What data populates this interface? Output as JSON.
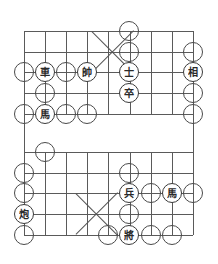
{
  "board": {
    "title": "Xiangqi Board",
    "type": "xiangqi-board",
    "files": 9,
    "ranks": 10,
    "geometry": {
      "left": 24,
      "top": 31,
      "col_step": 21.1,
      "row_step": 20.6,
      "river_top_row_y": 114,
      "river_bottom_row_y": 152,
      "piece_diameter": 20,
      "node_diameter": 20
    },
    "colors": {
      "line": "#5a5a5a",
      "piece_border": "#3a3a3a",
      "piece_text": "#2a2a2a",
      "node_border": "#4a4a4a",
      "background": "#ffffff"
    },
    "palaces": [
      {
        "name": "top-palace",
        "cx": 113,
        "cy": 52,
        "half": 21
      },
      {
        "name": "bottom-palace",
        "cx": 97,
        "cy": 214,
        "half": 21
      }
    ],
    "pieces": [
      {
        "id": "p1",
        "label": "車",
        "name": "piece-chariot-rook",
        "x": 45,
        "y": 72
      },
      {
        "id": "p2",
        "label": "帥",
        "name": "piece-marshal-red-king",
        "x": 87,
        "y": 72
      },
      {
        "id": "p3",
        "label": "士",
        "name": "piece-advisor",
        "x": 129,
        "y": 72
      },
      {
        "id": "p4",
        "label": "相",
        "name": "piece-minister-elephant",
        "x": 193,
        "y": 72
      },
      {
        "id": "p5",
        "label": "卒",
        "name": "piece-pawn-black",
        "x": 129,
        "y": 93
      },
      {
        "id": "p6",
        "label": "馬",
        "name": "piece-horse-top",
        "x": 45,
        "y": 114
      },
      {
        "id": "p7",
        "label": "兵",
        "name": "piece-soldier-red",
        "x": 129,
        "y": 193
      },
      {
        "id": "p8",
        "label": "馬",
        "name": "piece-horse-bottom",
        "x": 172,
        "y": 193
      },
      {
        "id": "p9",
        "label": "炮",
        "name": "piece-cannon",
        "x": 24,
        "y": 214
      },
      {
        "id": "p10",
        "label": "將",
        "name": "piece-general-black-king",
        "x": 129,
        "y": 235
      }
    ],
    "markers": [
      {
        "id": "m1",
        "x": 129,
        "y": 31
      },
      {
        "id": "m2",
        "x": 129,
        "y": 52
      },
      {
        "id": "m3",
        "x": 193,
        "y": 52
      },
      {
        "id": "m4",
        "x": 24,
        "y": 72
      },
      {
        "id": "m5",
        "x": 66,
        "y": 72
      },
      {
        "id": "m6",
        "x": 45,
        "y": 93
      },
      {
        "id": "m7",
        "x": 193,
        "y": 93
      },
      {
        "id": "m8",
        "x": 24,
        "y": 114
      },
      {
        "id": "m9",
        "x": 66,
        "y": 114
      },
      {
        "id": "m10",
        "x": 87,
        "y": 114
      },
      {
        "id": "m11",
        "x": 193,
        "y": 114
      },
      {
        "id": "m12",
        "x": 45,
        "y": 152
      },
      {
        "id": "m13",
        "x": 24,
        "y": 173
      },
      {
        "id": "m14",
        "x": 129,
        "y": 173
      },
      {
        "id": "m15",
        "x": 24,
        "y": 193
      },
      {
        "id": "m16",
        "x": 151,
        "y": 193
      },
      {
        "id": "m17",
        "x": 193,
        "y": 193
      },
      {
        "id": "m18",
        "x": 129,
        "y": 214
      },
      {
        "id": "m19",
        "x": 24,
        "y": 235
      },
      {
        "id": "m20",
        "x": 108,
        "y": 235
      },
      {
        "id": "m21",
        "x": 151,
        "y": 235
      },
      {
        "id": "m22",
        "x": 172,
        "y": 235
      }
    ]
  }
}
